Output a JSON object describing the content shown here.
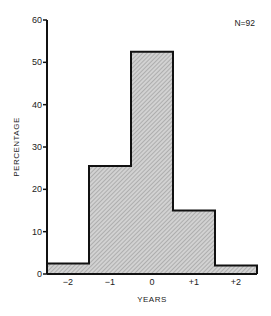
{
  "chart_data": {
    "type": "bar",
    "title": "",
    "annotation": "N=92",
    "xlabel": "YEARS",
    "ylabel": "PERCENTAGE",
    "categories": [
      "-2",
      "-1",
      "0",
      "+1",
      "+2"
    ],
    "values": [
      2.5,
      25.5,
      52.5,
      15,
      2
    ],
    "ylim": [
      0,
      60
    ],
    "yticks": [
      "0",
      "10",
      "20",
      "30",
      "40",
      "50",
      "60"
    ],
    "xtick_labels": [
      "−2",
      "−1",
      "0",
      "+1",
      "+2"
    ],
    "grid": false,
    "legend": null,
    "bar_fill": "#c8c8c8",
    "bar_hatch": "diagonal",
    "bar_edge": "#111111"
  }
}
